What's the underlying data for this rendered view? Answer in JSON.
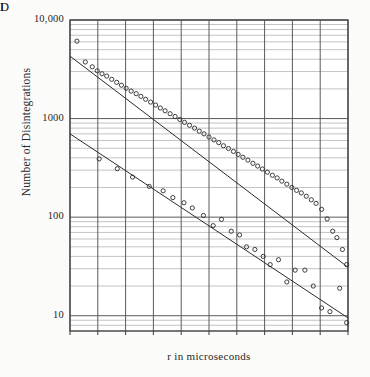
{
  "figure": {
    "title": "",
    "y_axis_title": "Number of Disintegrations",
    "x_axis_title": "r in microseconds",
    "curve_label_upper": "I",
    "curve_label_lower": "D",
    "y_ticks": [
      "10,000",
      "1000",
      "100",
      "10"
    ],
    "x_ticks": [
      "0",
      "1",
      "2",
      "3",
      "4",
      "5",
      "6",
      "7",
      "8",
      "9",
      "10"
    ],
    "colors": {
      "frame": "#4a4a4a",
      "major_grid": "#5a5a5a",
      "minor_grid": "#9a9a9a",
      "marker": "#2b2b2b",
      "fit_line": "#2b2b2b",
      "background": "#fbfbf9"
    }
  },
  "chart_data": {
    "type": "scatter",
    "title": "",
    "xlabel": "r in microseconds",
    "ylabel": "Number of Disintegrations",
    "xlim": [
      0,
      10
    ],
    "ylim": [
      7,
      10000
    ],
    "yscale": "log",
    "xscale": "linear",
    "grid": true,
    "legend": "inline-curve-labels",
    "y_tick_values": [
      10,
      100,
      1000,
      10000
    ],
    "y_tick_labels": [
      "10",
      "100",
      "1000",
      "10,000"
    ],
    "x_tick_values": [
      0,
      1,
      2,
      3,
      4,
      5,
      6,
      7,
      8,
      9,
      10
    ],
    "annotations": [
      {
        "text": "I",
        "x": 3.15,
        "y": 1350
      },
      {
        "text": "D",
        "x": 4.45,
        "y": 165
      }
    ],
    "series": [
      {
        "name": "I",
        "label": "I",
        "marker": "open-circle",
        "fit_line": {
          "y_intercept": 4300,
          "y_at_xmax": 31,
          "type": "exponential-decay"
        },
        "points": [
          {
            "x": 0.25,
            "y": 6100
          },
          {
            "x": 0.55,
            "y": 3750
          },
          {
            "x": 0.8,
            "y": 3350
          },
          {
            "x": 0.98,
            "y": 3050
          },
          {
            "x": 1.15,
            "y": 2850
          },
          {
            "x": 1.32,
            "y": 2700
          },
          {
            "x": 1.5,
            "y": 2500
          },
          {
            "x": 1.68,
            "y": 2330
          },
          {
            "x": 1.85,
            "y": 2180
          },
          {
            "x": 2.02,
            "y": 2030
          },
          {
            "x": 2.2,
            "y": 1900
          },
          {
            "x": 2.38,
            "y": 1790
          },
          {
            "x": 2.55,
            "y": 1680
          },
          {
            "x": 2.72,
            "y": 1570
          },
          {
            "x": 2.9,
            "y": 1470
          },
          {
            "x": 3.08,
            "y": 1370
          },
          {
            "x": 3.25,
            "y": 1280
          },
          {
            "x": 3.42,
            "y": 1200
          },
          {
            "x": 3.6,
            "y": 1120
          },
          {
            "x": 3.78,
            "y": 1050
          },
          {
            "x": 3.95,
            "y": 980
          },
          {
            "x": 4.12,
            "y": 915
          },
          {
            "x": 4.3,
            "y": 855
          },
          {
            "x": 4.48,
            "y": 800
          },
          {
            "x": 4.65,
            "y": 745
          },
          {
            "x": 4.82,
            "y": 700
          },
          {
            "x": 5.0,
            "y": 650
          },
          {
            "x": 5.18,
            "y": 608
          },
          {
            "x": 5.35,
            "y": 570
          },
          {
            "x": 5.52,
            "y": 530
          },
          {
            "x": 5.7,
            "y": 497
          },
          {
            "x": 5.88,
            "y": 464
          },
          {
            "x": 6.05,
            "y": 433
          },
          {
            "x": 6.22,
            "y": 405
          },
          {
            "x": 6.4,
            "y": 379
          },
          {
            "x": 6.58,
            "y": 352
          },
          {
            "x": 6.75,
            "y": 330
          },
          {
            "x": 6.92,
            "y": 308
          },
          {
            "x": 7.1,
            "y": 286
          },
          {
            "x": 7.28,
            "y": 266
          },
          {
            "x": 7.45,
            "y": 250
          },
          {
            "x": 7.62,
            "y": 232
          },
          {
            "x": 7.8,
            "y": 216
          },
          {
            "x": 7.98,
            "y": 200
          },
          {
            "x": 8.15,
            "y": 187
          },
          {
            "x": 8.32,
            "y": 176
          },
          {
            "x": 8.5,
            "y": 163
          },
          {
            "x": 8.68,
            "y": 150
          },
          {
            "x": 8.85,
            "y": 138
          },
          {
            "x": 9.05,
            "y": 120
          },
          {
            "x": 9.25,
            "y": 96
          },
          {
            "x": 9.45,
            "y": 72
          },
          {
            "x": 9.6,
            "y": 62
          },
          {
            "x": 9.8,
            "y": 47
          },
          {
            "x": 9.95,
            "y": 33
          }
        ]
      },
      {
        "name": "D",
        "label": "D",
        "marker": "open-circle",
        "fit_line": {
          "y_intercept": 700,
          "y_at_xmax": 9.5,
          "type": "exponential-decay"
        },
        "points": [
          {
            "x": 1.05,
            "y": 390
          },
          {
            "x": 1.7,
            "y": 310
          },
          {
            "x": 2.25,
            "y": 255
          },
          {
            "x": 2.85,
            "y": 205
          },
          {
            "x": 3.35,
            "y": 185
          },
          {
            "x": 3.7,
            "y": 158
          },
          {
            "x": 4.1,
            "y": 140
          },
          {
            "x": 4.4,
            "y": 124
          },
          {
            "x": 4.8,
            "y": 104
          },
          {
            "x": 5.15,
            "y": 82
          },
          {
            "x": 5.45,
            "y": 95
          },
          {
            "x": 5.8,
            "y": 72
          },
          {
            "x": 6.1,
            "y": 66
          },
          {
            "x": 6.35,
            "y": 50
          },
          {
            "x": 6.65,
            "y": 47
          },
          {
            "x": 6.95,
            "y": 40
          },
          {
            "x": 7.2,
            "y": 33
          },
          {
            "x": 7.5,
            "y": 37
          },
          {
            "x": 7.8,
            "y": 22
          },
          {
            "x": 8.1,
            "y": 29
          },
          {
            "x": 8.45,
            "y": 29
          },
          {
            "x": 8.75,
            "y": 20
          },
          {
            "x": 9.05,
            "y": 12
          },
          {
            "x": 9.35,
            "y": 11
          },
          {
            "x": 9.7,
            "y": 19
          },
          {
            "x": 9.95,
            "y": 8.5
          }
        ]
      }
    ]
  }
}
